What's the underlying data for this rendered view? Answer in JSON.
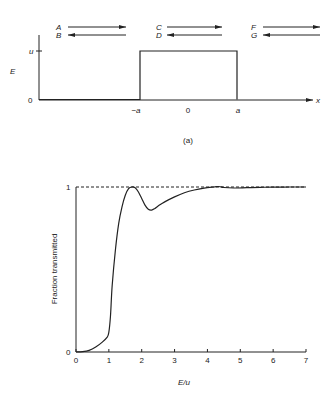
{
  "diagram_a": {
    "caption": "(a)",
    "y_axis_label": "E",
    "y_ticks": [
      "u",
      "0"
    ],
    "x_axis_label": "x",
    "x_ticks": [
      "−a",
      "0",
      "a"
    ],
    "waves": [
      {
        "right": "A",
        "left": "B"
      },
      {
        "right": "C",
        "left": "D"
      },
      {
        "right": "F",
        "left": "G"
      }
    ],
    "barrier": {
      "height": "u",
      "from": "-a",
      "to": "a"
    }
  },
  "chart_data": {
    "type": "line",
    "title": "",
    "xlabel": "E/u",
    "ylabel": "Fraction transmitted",
    "xlim": [
      0,
      7
    ],
    "ylim": [
      0,
      1
    ],
    "x_ticks": [
      "0",
      "1",
      "2",
      "3",
      "4",
      "5",
      "6",
      "7"
    ],
    "y_ticks": [
      "0",
      "1"
    ],
    "reference_line": {
      "y": 1,
      "style": "dashed"
    },
    "series": [
      {
        "name": "Fraction transmitted",
        "x": [
          0,
          0.2,
          0.4,
          0.6,
          0.8,
          0.95,
          1.0,
          1.05,
          1.1,
          1.2,
          1.3,
          1.4,
          1.5,
          1.6,
          1.7,
          1.8,
          1.9,
          2.0,
          2.1,
          2.2,
          2.3,
          2.4,
          2.5,
          2.7,
          3.0,
          3.3,
          3.6,
          3.9,
          4.2,
          4.35,
          4.5,
          4.8,
          5.2,
          5.6,
          6.0,
          6.5,
          7.0
        ],
        "y": [
          0,
          0.002,
          0.01,
          0.03,
          0.06,
          0.09,
          0.12,
          0.22,
          0.4,
          0.62,
          0.78,
          0.88,
          0.95,
          0.99,
          1.0,
          0.995,
          0.97,
          0.93,
          0.89,
          0.865,
          0.86,
          0.87,
          0.885,
          0.91,
          0.94,
          0.965,
          0.982,
          0.993,
          1.0,
          1.003,
          0.997,
          0.994,
          0.996,
          0.998,
          0.999,
          1.0,
          1.0
        ]
      }
    ]
  }
}
